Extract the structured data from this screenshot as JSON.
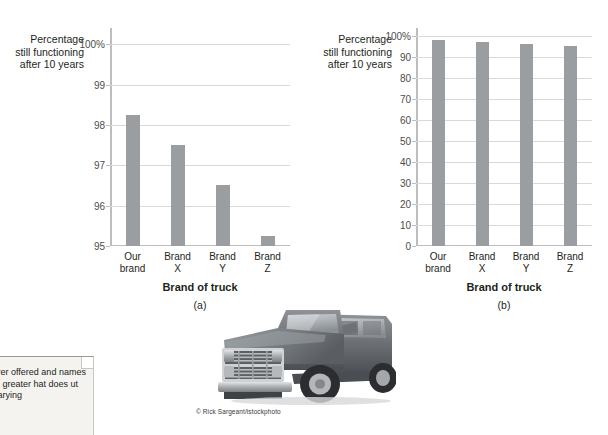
{
  "figure": {
    "credit": "© Rick Sargeant/istockphoto",
    "truck_alt": "grayscale-pickup-truck-photo"
  },
  "callout": {
    "text": "facturer offered\nand names\nmuch greater\nhat does\nut the varying"
  },
  "chart_data": [
    {
      "id": "a",
      "type": "bar",
      "title": "",
      "panel_label": "(a)",
      "ylabel": "Percentage\nstill functioning\nafter 10 years",
      "xlabel": "Brand of truck",
      "categories": [
        "Our\nbrand",
        "Brand\nX",
        "Brand\nY",
        "Brand\nZ"
      ],
      "values": [
        98.25,
        97.5,
        96.5,
        95.25
      ],
      "ylim": [
        95,
        100.4
      ],
      "yticks": [
        95,
        96,
        97,
        98,
        99,
        100
      ],
      "ytick_labels": [
        "95",
        "96",
        "97",
        "98",
        "99",
        "100%"
      ],
      "grid": true,
      "legend": "none",
      "bar_color": "#9b9ea1"
    },
    {
      "id": "b",
      "type": "bar",
      "title": "",
      "panel_label": "(b)",
      "ylabel": "Percentage\nstill functioning\nafter 10 years",
      "xlabel": "Brand of truck",
      "categories": [
        "Our\nbrand",
        "Brand\nX",
        "Brand\nY",
        "Brand\nZ"
      ],
      "values": [
        98.25,
        97.5,
        96.5,
        95.25
      ],
      "ylim": [
        0,
        104
      ],
      "yticks": [
        0,
        10,
        20,
        30,
        40,
        50,
        60,
        70,
        80,
        90,
        100
      ],
      "ytick_labels": [
        "0",
        "10",
        "20",
        "30",
        "40",
        "50",
        "60",
        "70",
        "80",
        "90",
        "100%"
      ],
      "grid": true,
      "legend": "none",
      "bar_color": "#9b9ea1"
    }
  ]
}
